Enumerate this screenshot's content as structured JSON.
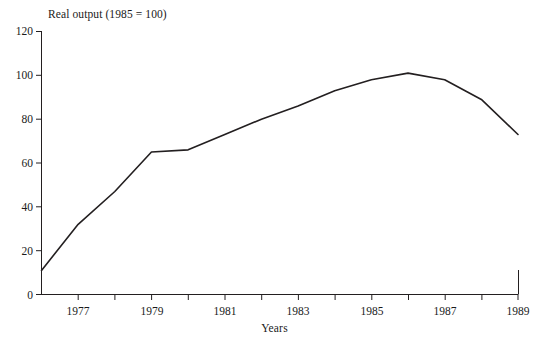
{
  "chart_data": {
    "type": "line",
    "title": "Real output (1985 = 100)",
    "xlabel": "Years",
    "ylabel": "",
    "x": [
      1976,
      1977,
      1978,
      1979,
      1980,
      1981,
      1982,
      1983,
      1984,
      1985,
      1986,
      1987,
      1988,
      1989
    ],
    "values": [
      11,
      32,
      47,
      65,
      66,
      73,
      80,
      86,
      93,
      98,
      101,
      98,
      89,
      73
    ],
    "series": [
      {
        "name": "Real output",
        "values": [
          11,
          32,
          47,
          65,
          66,
          73,
          80,
          86,
          93,
          98,
          101,
          98,
          89,
          73
        ]
      }
    ],
    "xlim": [
      1976,
      1989
    ],
    "ylim": [
      0,
      120
    ],
    "ytick_values": [
      0,
      20,
      40,
      60,
      80,
      100,
      120
    ],
    "ytick_labels": [
      "0",
      "20",
      "40",
      "60",
      "80",
      "100",
      "120"
    ],
    "xtick_values": [
      1977,
      1978,
      1979,
      1980,
      1981,
      1982,
      1983,
      1984,
      1985,
      1986,
      1987,
      1988,
      1989
    ],
    "xtick_labels": [
      "1977",
      "",
      "1979",
      "",
      "1981",
      "",
      "1983",
      "",
      "1985",
      "",
      "1987",
      "",
      "1989"
    ],
    "xtick_labels_shown": [
      "1977",
      "1979",
      "1981",
      "1983",
      "1985",
      "1987",
      "1989"
    ],
    "grid": false,
    "legend": "none",
    "line_color": "#231f20",
    "axis_color": "#231f20",
    "background_color": "#ffffff"
  },
  "axes": {
    "y_ticks": [
      {
        "label": "120",
        "value": 120
      },
      {
        "label": "100",
        "value": 100
      },
      {
        "label": "80",
        "value": 80
      },
      {
        "label": "60",
        "value": 60
      },
      {
        "label": "40",
        "value": 40
      },
      {
        "label": "20",
        "value": 20
      },
      {
        "label": "0",
        "value": 0
      }
    ],
    "x_ticks": [
      {
        "label": "1977",
        "value": 1977
      },
      {
        "label": "1979",
        "value": 1979
      },
      {
        "label": "1981",
        "value": 1981
      },
      {
        "label": "1983",
        "value": 1983
      },
      {
        "label": "1985",
        "value": 1985
      },
      {
        "label": "1987",
        "value": 1987
      },
      {
        "label": "1989",
        "value": 1989
      }
    ]
  }
}
